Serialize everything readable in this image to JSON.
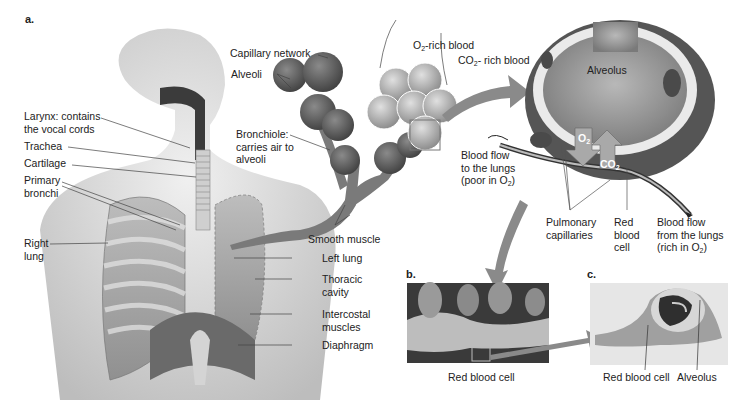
{
  "panels": {
    "a": "a.",
    "b": "b.",
    "c": "c."
  },
  "labels": {
    "larynx_1": "Larynx: contains",
    "larynx_2": "the vocal cords",
    "trachea": "Trachea",
    "cartilage": "Cartilage",
    "primary_bronchi_1": "Primary",
    "primary_bronchi_2": "bronchi",
    "right_lung_1": "Right",
    "right_lung_2": "lung",
    "capillary_network": "Capillary network",
    "alveoli": "Alveoli",
    "bronchiole_1": "Bronchiole:",
    "bronchiole_2": "carries air to",
    "bronchiole_3": "alveoli",
    "smooth_muscle": "Smooth muscle",
    "left_lung": "Left lung",
    "thoracic_cavity_1": "Thoracic",
    "thoracic_cavity_2": "cavity",
    "intercostal_1": "Intercostal",
    "intercostal_2": "muscles",
    "diaphragm": "Diaphragm",
    "o2_rich_pre": "O",
    "o2_rich_sub": "2",
    "o2_rich_post": "-rich blood",
    "co2_rich_pre": "CO",
    "co2_rich_sub": "2",
    "co2_rich_post": "- rich blood",
    "alveolus": "Alveolus",
    "o2_arrow_pre": "O",
    "o2_arrow_sub": "2",
    "co2_arrow_pre": "CO",
    "co2_arrow_sub": "2",
    "flow_to_1": "Blood flow",
    "flow_to_2": "to the lungs",
    "flow_to_3_pre": "(poor in O",
    "flow_to_3_sub": "2",
    "flow_to_3_post": ")",
    "pulmonary_1": "Pulmonary",
    "pulmonary_2": "capillaries",
    "rbc_1": "Red",
    "rbc_2": "blood",
    "rbc_3": "cell",
    "flow_from_1": "Blood flow",
    "flow_from_2": "from the lungs",
    "flow_from_3_pre": "(rich in O",
    "flow_from_3_sub": "2",
    "flow_from_3_post": ")",
    "b_rbc": "Red blood cell",
    "c_rbc": "Red blood cell",
    "c_alveolus": "Alveolus"
  },
  "colors": {
    "text": "#222222",
    "arrow": "#8a8a8a",
    "tissue_dark": "#5a5a5a",
    "tissue_mid": "#9a9a9a",
    "skin": "#d8d8d8"
  }
}
